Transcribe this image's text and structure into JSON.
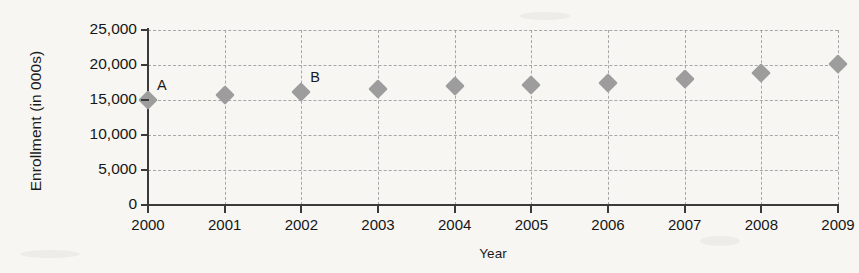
{
  "chart_data": {
    "type": "scatter",
    "title": "",
    "xlabel": "Year",
    "ylabel": "Enrollment (in 000s)",
    "categories": [
      "2000",
      "2001",
      "2002",
      "2003",
      "2004",
      "2005",
      "2006",
      "2007",
      "2008",
      "2009"
    ],
    "x": [
      2000,
      2001,
      2002,
      2003,
      2004,
      2005,
      2006,
      2007,
      2008,
      2009
    ],
    "values": [
      15000,
      15700,
      16200,
      16600,
      17000,
      17200,
      17500,
      18000,
      18900,
      20200
    ],
    "series": [
      {
        "name": "Enrollment",
        "values": [
          15000,
          15700,
          16200,
          16600,
          17000,
          17200,
          17500,
          18000,
          18900,
          20200
        ]
      }
    ],
    "ylim": [
      0,
      25000
    ],
    "xlim": [
      2000,
      2009
    ],
    "ytick_labels": [
      "0",
      "5,000",
      "10,000",
      "15,000",
      "20,000",
      "25,000"
    ],
    "ytick_values": [
      0,
      5000,
      10000,
      15000,
      20000,
      25000
    ],
    "xtick_labels": [
      "2000",
      "2001",
      "2002",
      "2003",
      "2004",
      "2005",
      "2006",
      "2007",
      "2008",
      "2009"
    ],
    "grid": true,
    "grid_style": "dashed",
    "legend": "none",
    "marker": "diamond",
    "marker_color": "#9d9d9d",
    "annotations": [
      {
        "label": "A",
        "x": 2000,
        "y": 15000
      },
      {
        "label": "B",
        "x": 2002,
        "y": 16200
      }
    ],
    "colors": {
      "marker": "#9d9d9d",
      "axis": "#3a3a3a",
      "grid": "#9a9a9a",
      "text": "#161616",
      "background": "#f7f6f3"
    }
  }
}
